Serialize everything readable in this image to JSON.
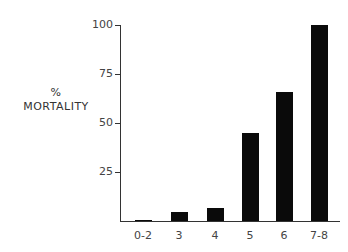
{
  "chart_data": {
    "type": "bar",
    "title": "",
    "xlabel": "",
    "ylabel": "% MORTALITY",
    "ylabel_lines": [
      "%",
      "MORTALITY"
    ],
    "categories": [
      "0-2",
      "3",
      "4",
      "5",
      "6",
      "7-8"
    ],
    "values": [
      0.5,
      4.5,
      6.5,
      45,
      66,
      100
    ],
    "ylim": [
      0,
      100
    ],
    "yticks": [
      25,
      50,
      75,
      100
    ],
    "ytick_labels": [
      "25",
      "50",
      "75",
      "100"
    ],
    "grid": false,
    "bar_color": "#0a0a0a"
  }
}
